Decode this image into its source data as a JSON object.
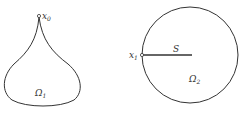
{
  "diagram": {
    "left_shape": {
      "point_label": "x",
      "point_sub": "0",
      "region_label": "Ω",
      "region_sub": "1"
    },
    "right_shape": {
      "point_label": "x",
      "point_sub": "1",
      "segment_label": "S",
      "region_label": "Ω",
      "region_sub": "2"
    },
    "colors": {
      "stroke": "#333333",
      "background": "#ffffff"
    }
  }
}
